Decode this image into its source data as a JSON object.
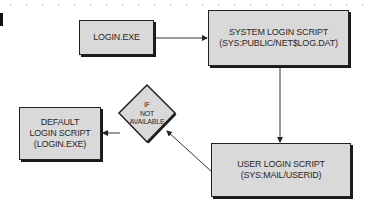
{
  "diagram": {
    "type": "flowchart",
    "nodes": [
      {
        "id": "login_exe",
        "shape": "rectangle",
        "lines": [
          "LOGIN.EXE"
        ]
      },
      {
        "id": "system_script",
        "shape": "rectangle",
        "lines": [
          "SYSTEM LOGIN SCRIPT",
          "(SYS:PUBLIC/NET$LOG.DAT)"
        ]
      },
      {
        "id": "user_script",
        "shape": "rectangle",
        "lines": [
          "USER LOGIN SCRIPT",
          "(SYS:MAIL/USERID)"
        ]
      },
      {
        "id": "decision",
        "shape": "diamond",
        "lines": [
          "IF",
          "NOT",
          "AVAILABLE"
        ]
      },
      {
        "id": "default_script",
        "shape": "rectangle",
        "lines": [
          "DEFAULT",
          "LOGIN SCRIPT",
          "(LOGIN.EXE)"
        ]
      }
    ],
    "edges": [
      {
        "from": "login_exe",
        "to": "system_script"
      },
      {
        "from": "system_script",
        "to": "user_script"
      },
      {
        "from": "user_script",
        "to": "decision"
      },
      {
        "from": "decision",
        "to": "default_script"
      }
    ],
    "colors": {
      "box_fill": "#d9d9d9",
      "border": "#222222",
      "text": "#2a2a2a",
      "line": "#333333"
    }
  }
}
